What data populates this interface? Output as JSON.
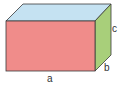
{
  "diagram": {
    "type": "cuboid",
    "labels": {
      "length": "a",
      "depth": "b",
      "height": "c"
    },
    "colors": {
      "front": "#f08c8a",
      "top": "#c5e2f2",
      "side": "#a8cf7a",
      "edge": "#3a3a3a"
    }
  }
}
